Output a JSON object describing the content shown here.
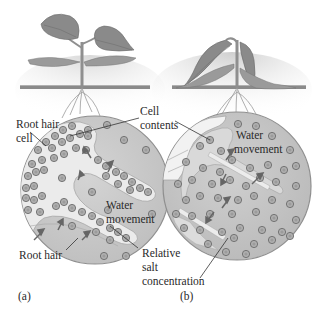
{
  "figure": {
    "panels": [
      {
        "id": "a",
        "caption": "(a)",
        "description": "Healthy upright seedling; root hair cells with high relative salt concentration; water moves into root hairs",
        "labels": {
          "root_hair_cell_line1": "Root hair",
          "root_hair_cell_line2": "cell",
          "cell_contents_line1": "Cell",
          "cell_contents_line2": "contents",
          "water_line1": "Water",
          "water_line2": "movement",
          "root_hair": "Root hair",
          "salt_line1": "Relative",
          "salt_line2": "salt",
          "salt_line3": "concentration"
        }
      },
      {
        "id": "b",
        "caption": "(b)",
        "description": "Wilted seedling; high salt concentration in soil; water moves out of root hairs",
        "labels": {
          "water_line1": "Water",
          "water_line2": "movement"
        }
      }
    ],
    "colors": {
      "background": "#ffffff",
      "soil_line": "#8a8a8a",
      "soil_shade": "#e6e6e6",
      "circle_fill": "#c9c9c9",
      "circle_stroke": "#8f8f8f",
      "root_fill": "#e9e9e9",
      "particle_fill": "#b5b5b5",
      "particle_stroke": "#6f6f6f",
      "leaf": "#8c8c8c",
      "text": "#2a2a2a"
    }
  }
}
